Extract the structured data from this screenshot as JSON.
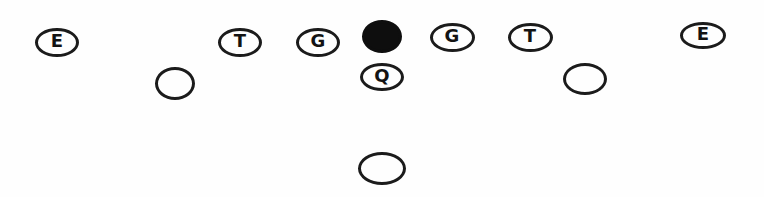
{
  "diagram": {
    "kind": "football-formation-diagram",
    "colors": {
      "background": "#fefefe",
      "outline": "#1b1b1b",
      "center_fill": "#0e0e0e",
      "letter": "#131313"
    },
    "players": [
      {
        "name": "left-end",
        "label": "E",
        "filled": false,
        "x": 57,
        "y": 42,
        "w": 44,
        "h": 29
      },
      {
        "name": "left-tackle",
        "label": "T",
        "filled": false,
        "x": 240,
        "y": 42,
        "w": 44,
        "h": 29
      },
      {
        "name": "left-guard",
        "label": "G",
        "filled": false,
        "x": 318,
        "y": 42,
        "w": 44,
        "h": 29
      },
      {
        "name": "center",
        "label": "",
        "filled": true,
        "x": 382,
        "y": 36,
        "w": 40,
        "h": 33
      },
      {
        "name": "right-guard",
        "label": "G",
        "filled": false,
        "x": 452,
        "y": 37,
        "w": 45,
        "h": 29
      },
      {
        "name": "right-tackle",
        "label": "T",
        "filled": false,
        "x": 530,
        "y": 37,
        "w": 45,
        "h": 29
      },
      {
        "name": "right-end",
        "label": "E",
        "filled": false,
        "x": 703,
        "y": 35,
        "w": 46,
        "h": 27
      },
      {
        "name": "left-halfback",
        "label": "",
        "filled": false,
        "x": 175,
        "y": 83,
        "w": 40,
        "h": 33
      },
      {
        "name": "quarterback",
        "label": "Q",
        "filled": false,
        "x": 382,
        "y": 77,
        "w": 44,
        "h": 28
      },
      {
        "name": "right-halfback",
        "label": "",
        "filled": false,
        "x": 585,
        "y": 79,
        "w": 44,
        "h": 32
      },
      {
        "name": "fullback",
        "label": "",
        "filled": false,
        "x": 382,
        "y": 168,
        "w": 48,
        "h": 33
      }
    ]
  }
}
